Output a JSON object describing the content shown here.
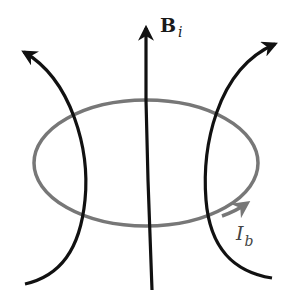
{
  "diagram": {
    "field_label": {
      "main": "B",
      "subscript": "i"
    },
    "current_label": {
      "main": "I",
      "subscript": "b"
    },
    "colors": {
      "field_lines": "#111111",
      "current_loop": "#777777",
      "background": "#ffffff"
    },
    "elements": [
      {
        "type": "field-line",
        "position": "center",
        "direction": "up",
        "arrow": true
      },
      {
        "type": "field-line",
        "position": "left",
        "direction": "up-left",
        "arrow": true
      },
      {
        "type": "field-line",
        "position": "right",
        "direction": "up-right",
        "arrow": true
      },
      {
        "type": "current-loop",
        "shape": "ellipse",
        "direction": "counterclockwise-viewed-from-above",
        "arrow": true
      }
    ]
  }
}
